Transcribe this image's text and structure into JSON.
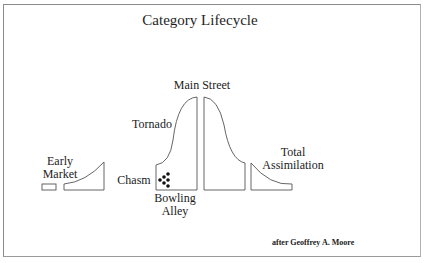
{
  "diagram": {
    "title": "Category Lifecycle",
    "credit": "after Geoffrey A. Moore",
    "stages": [
      {
        "id": "early-market",
        "label_line1": "Early",
        "label_line2": "Market"
      },
      {
        "id": "chasm",
        "label": "Chasm"
      },
      {
        "id": "bowling-alley",
        "label_line1": "Bowling",
        "label_line2": "Alley"
      },
      {
        "id": "tornado",
        "label": "Tornado"
      },
      {
        "id": "main-street",
        "label": "Main Street"
      },
      {
        "id": "total-assimilation",
        "label_line1": "Total",
        "label_line2": "Assimilation"
      }
    ],
    "colors": {
      "stroke": "#555555",
      "text": "#222222",
      "dots": "#111111",
      "frame": "#8a8a8a"
    }
  }
}
